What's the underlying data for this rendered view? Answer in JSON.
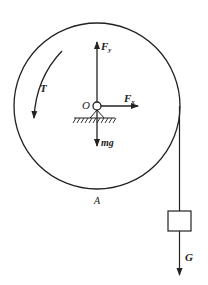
{
  "diagram": {
    "colors": {
      "stroke": "#222222",
      "background": "#ffffff"
    },
    "wheel": {
      "label": "A",
      "center": [
        97,
        106
      ],
      "radius": 83
    },
    "pivot": {
      "label": "O"
    },
    "forces": {
      "fy": {
        "symbol": "F",
        "subscript": "y",
        "direction": "up"
      },
      "fx": {
        "symbol": "F",
        "subscript": "x",
        "direction": "right"
      },
      "weight_wheel": {
        "label": "mg",
        "direction": "down"
      },
      "torque": {
        "label": "T",
        "direction": "counterclockwise"
      },
      "weight_block": {
        "label": "G",
        "direction": "down"
      }
    },
    "block": {
      "shape": "square",
      "hanging_by": "rope"
    }
  }
}
